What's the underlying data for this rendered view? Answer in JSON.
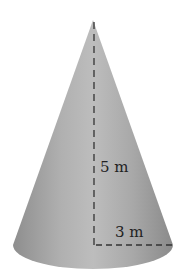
{
  "figure": {
    "shape": "cone",
    "height_label": "5 m",
    "radius_label": "3 m",
    "colors": {
      "cone_fill": "#a6a6a6",
      "cone_highlight": "#c4c4c4",
      "cone_shadow": "#8c8c8c",
      "dash_line": "#333333",
      "label_text": "#222222",
      "background": "#ffffff"
    }
  }
}
